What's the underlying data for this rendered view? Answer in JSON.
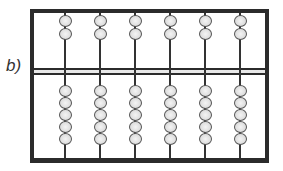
{
  "label": "b)",
  "abacus": {
    "rods": 6,
    "upper_beads_per_rod": 2,
    "lower_beads_per_rod": 5,
    "rod_x": [
      30,
      65,
      100,
      135,
      170,
      205
    ],
    "upper_bead_y": [
      2,
      15
    ],
    "lower_bead_y": [
      72,
      84,
      96,
      108,
      120
    ],
    "divider_y": 55,
    "frame_color": "#2b2b2b",
    "bead_color": "#dcdcdc"
  }
}
